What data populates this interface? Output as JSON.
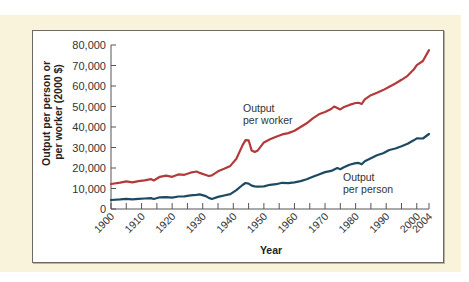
{
  "chart_data": {
    "type": "line",
    "title": "",
    "xlabel": "Year",
    "ylabel": "Output per person or per worker (2000 $)",
    "ylabel_lines": [
      "Output per person or",
      "per worker (2000 $)"
    ],
    "xlim": [
      1900,
      2004
    ],
    "ylim": [
      0,
      80000
    ],
    "grid": false,
    "legend": "inline annotations",
    "x_ticks": [
      "1900",
      "1910",
      "1920",
      "1930",
      "1940",
      "1950",
      "1960",
      "1970",
      "1980",
      "1990",
      "2000",
      "2004"
    ],
    "y_ticks": [
      "0",
      "10,000",
      "20,000",
      "30,000",
      "40,000",
      "50,000",
      "60,000",
      "70,000",
      "80,000"
    ],
    "series": [
      {
        "name": "Output per worker",
        "annotation": [
          "Output",
          "per worker"
        ],
        "color": "#b23a3a",
        "x": [
          1900,
          1903,
          1905,
          1907,
          1909,
          1911,
          1913,
          1914,
          1916,
          1918,
          1920,
          1922,
          1924,
          1926,
          1928,
          1929,
          1931,
          1932,
          1933,
          1935,
          1937,
          1939,
          1941,
          1943,
          1944,
          1945,
          1946,
          1947,
          1948,
          1950,
          1952,
          1954,
          1956,
          1958,
          1960,
          1962,
          1964,
          1966,
          1968,
          1970,
          1972,
          1973,
          1974,
          1975,
          1976,
          1978,
          1980,
          1981,
          1982,
          1983,
          1985,
          1987,
          1989,
          1991,
          1993,
          1995,
          1997,
          1999,
          2000,
          2002,
          2004
        ],
        "values": [
          12200,
          12900,
          13500,
          13000,
          13600,
          14000,
          14600,
          13900,
          15700,
          16300,
          15700,
          16900,
          16700,
          17700,
          18300,
          17600,
          16600,
          16100,
          16400,
          18400,
          19600,
          21000,
          24500,
          31000,
          33600,
          33500,
          28500,
          27800,
          28600,
          32500,
          34000,
          35200,
          36400,
          37000,
          38200,
          40000,
          41800,
          44200,
          46200,
          47300,
          48800,
          50000,
          49300,
          48600,
          49600,
          50800,
          51700,
          51800,
          51200,
          53500,
          55500,
          56700,
          58000,
          59600,
          61200,
          63000,
          65000,
          68000,
          70200,
          72200,
          77500
        ]
      },
      {
        "name": "Output per person",
        "annotation": [
          "Output",
          "per person"
        ],
        "color": "#1d4a63",
        "x": [
          1900,
          1903,
          1905,
          1907,
          1909,
          1911,
          1913,
          1914,
          1916,
          1918,
          1920,
          1922,
          1924,
          1926,
          1928,
          1929,
          1931,
          1932,
          1933,
          1935,
          1937,
          1939,
          1941,
          1943,
          1944,
          1945,
          1946,
          1947,
          1948,
          1950,
          1952,
          1954,
          1956,
          1958,
          1960,
          1962,
          1964,
          1966,
          1968,
          1970,
          1972,
          1974,
          1975,
          1976,
          1978,
          1980,
          1981,
          1982,
          1983,
          1985,
          1987,
          1989,
          1991,
          1993,
          1995,
          1997,
          1999,
          2000,
          2002,
          2004
        ],
        "values": [
          4400,
          4700,
          5000,
          4700,
          5000,
          5100,
          5300,
          4900,
          5700,
          5800,
          5500,
          6100,
          6200,
          6700,
          6900,
          7100,
          6300,
          5400,
          4900,
          5900,
          6600,
          7200,
          9200,
          11700,
          12700,
          12400,
          11400,
          11000,
          10900,
          11000,
          11800,
          12100,
          12800,
          12600,
          13000,
          13600,
          14500,
          15700,
          16900,
          18000,
          18600,
          20000,
          19400,
          20200,
          21600,
          22400,
          22500,
          21800,
          23300,
          24800,
          26200,
          27200,
          28800,
          29500,
          30600,
          31800,
          33500,
          34500,
          34400,
          36600
        ]
      }
    ]
  }
}
